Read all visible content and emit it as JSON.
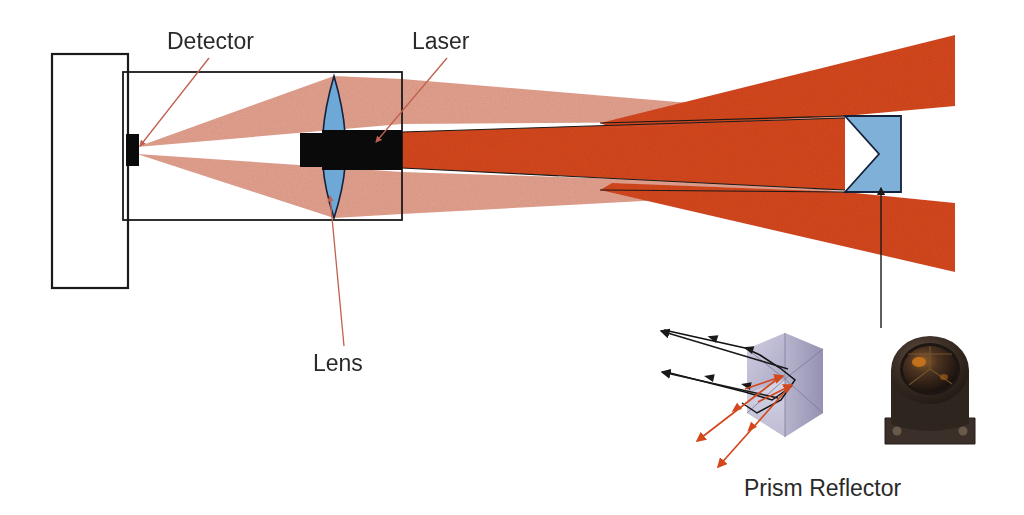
{
  "figure": {
    "background": "#ffffff"
  },
  "labels": {
    "detector": "Detector",
    "laser": "Laser",
    "lens": "Lens",
    "prism_reflector": "Prism Reflector"
  },
  "colors": {
    "beam_outgoing": "#D4471C",
    "beam_return": "#E3A08E",
    "lens_blue": "#6DA8D6",
    "prism_blue": "#7FB0D8",
    "body_black": "#0A0A0A",
    "outline": "#1A1A1A",
    "leader_red": "#C0604F",
    "prism_3d_light": "#C8C6DC",
    "prism_3d_mid": "#A9A6C4",
    "prism_3d_dark": "#8C89AA",
    "photo_dark": "#2B211B",
    "photo_mid": "#4A3A2E",
    "photo_highlight": "#C8731E",
    "text": "#2A2A2A"
  },
  "components": {
    "instrument_body": {
      "name": "instrument housing",
      "x": 52,
      "y": 54,
      "width": 76,
      "height": 234
    },
    "detector": {
      "name": "detector element",
      "x": 126,
      "y": 134,
      "width": 13,
      "height": 32
    },
    "optics_frame": {
      "name": "optics bench frame",
      "x": 123,
      "y": 72,
      "width": 279,
      "height": 148
    },
    "lens": {
      "name": "collecting lens",
      "cx": 334,
      "top": 76,
      "bottom": 218,
      "half_width": 12
    },
    "laser_module": {
      "name": "laser module",
      "x": 322,
      "y": 130,
      "width": 80,
      "height": 40
    },
    "prism_target": {
      "name": "corner prism reflector target",
      "x": 845,
      "y": 116,
      "width": 56,
      "height": 76,
      "notch_depth": 34
    }
  },
  "beams": {
    "outgoing": {
      "label": "transmitted laser beam",
      "color": "#D4471C",
      "from": "laser module",
      "to": "prism reflector"
    },
    "returning": {
      "label": "returned beam to detector",
      "color": "#E3A08E",
      "from": "prism reflector",
      "to": "detector"
    }
  },
  "inset": {
    "caption": "Prism Reflector",
    "incoming_ray_count": 2,
    "outgoing_ray_count": 2,
    "incoming_color": "#D4471C",
    "outgoing_color": "#1A1A1A",
    "photo_caption_shared": true
  },
  "leaders": [
    {
      "name": "detector-leader",
      "from_label": "Detector",
      "to_component": "detector"
    },
    {
      "name": "laser-leader",
      "from_label": "Laser",
      "to_component": "laser_module"
    },
    {
      "name": "lens-leader",
      "from_label": "Lens",
      "to_component": "lens"
    },
    {
      "name": "prism-pointer",
      "from_label": "Prism Reflector inset",
      "to_component": "prism_target"
    }
  ]
}
